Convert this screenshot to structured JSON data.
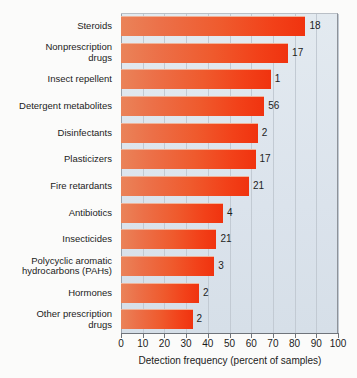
{
  "chart_data": {
    "type": "bar",
    "orientation": "horizontal",
    "title": "",
    "xlabel": "Detection frequency (percent of samples)",
    "ylabel": "",
    "xlim": [
      0,
      100
    ],
    "xticks": [
      "0",
      "10",
      "20",
      "30",
      "40",
      "50",
      "60",
      "70",
      "80",
      "90",
      "100"
    ],
    "grid": true,
    "legend": "none",
    "categories": [
      "Steroids",
      "Nonprescription drugs",
      "Insect repellent",
      "Detergent metabolites",
      "Disinfectants",
      "Plasticizers",
      "Fire retardants",
      "Antibiotics",
      "Insecticides",
      "Polycyclic aromatic hydrocarbons (PAHs)",
      "Hormones",
      "Other prescription drugs"
    ],
    "values": [
      85,
      77,
      69,
      66,
      63,
      62,
      59,
      47,
      44,
      43,
      36,
      33
    ],
    "annotations": [
      "18",
      "17",
      "1",
      "56",
      "2",
      "17",
      "21",
      "4",
      "21",
      "3",
      "2",
      "2"
    ],
    "bar_color_start": "#ea8359",
    "bar_color_end": "#f0330f",
    "plot_background": "#dde5ec"
  },
  "labels": {
    "rows": [
      {
        "lines": [
          "Steroids"
        ],
        "value": "18"
      },
      {
        "lines": [
          "Nonprescription",
          "drugs"
        ],
        "value": "17"
      },
      {
        "lines": [
          "Insect repellent"
        ],
        "value": "1"
      },
      {
        "lines": [
          "Detergent metabolites"
        ],
        "value": "56"
      },
      {
        "lines": [
          "Disinfectants"
        ],
        "value": "2"
      },
      {
        "lines": [
          "Plasticizers"
        ],
        "value": "17"
      },
      {
        "lines": [
          "Fire retardants"
        ],
        "value": "21"
      },
      {
        "lines": [
          "Antibiotics"
        ],
        "value": "4"
      },
      {
        "lines": [
          "Insecticides"
        ],
        "value": "21"
      },
      {
        "lines": [
          "Polycyclic aromatic",
          "hydrocarbons (PAHs)"
        ],
        "value": "3"
      },
      {
        "lines": [
          "Hormones"
        ],
        "value": "2"
      },
      {
        "lines": [
          "Other prescription",
          "drugs"
        ],
        "value": "2"
      }
    ]
  },
  "axis": {
    "title": "Detection frequency (percent of samples)",
    "ticks": [
      "0",
      "10",
      "20",
      "30",
      "40",
      "50",
      "60",
      "70",
      "80",
      "90",
      "100"
    ]
  }
}
